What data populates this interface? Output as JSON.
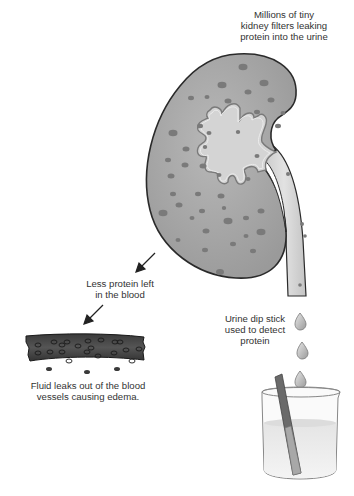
{
  "diagram": {
    "labels": {
      "kidney_filters": [
        "Millions of tiny",
        "kidney filters leaking",
        "protein into the urine"
      ],
      "less_protein": [
        "Less protein left",
        "in the blood"
      ],
      "dip_stick": [
        "Urine dip stick",
        "used to detect",
        "protein"
      ],
      "edema": [
        "Fluid leaks out of the blood",
        "vessels causing edema."
      ]
    },
    "elements": {
      "kidney": "kidney-with-filters",
      "ureter": "ureter-tube",
      "blood_vessel": "blood-vessel-segment",
      "droplets": 3,
      "beaker": "urine-beaker",
      "dip_stick": "test-strip"
    },
    "colors": {
      "kidney_fill": "#a8a8a8",
      "kidney_outline": "#2a2a2a",
      "pelvis_fill": "#d4d4d4",
      "spot": "#7a7a7a",
      "vessel": "#4a4a4a",
      "text": "#333333"
    }
  }
}
